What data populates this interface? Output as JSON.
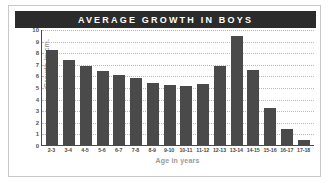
{
  "card": {
    "title": "AVERAGE GROWTH IN BOYS",
    "title_bg_color": "#2b2b2b",
    "title_text_color": "#ffffff",
    "border_color": "#c8c8c8",
    "background_color": "#ffffff"
  },
  "chart_data": {
    "type": "bar",
    "title": "AVERAGE GROWTH IN BOYS",
    "xlabel": "Age in years",
    "ylabel": "Growth in cm.",
    "categories": [
      "2-3",
      "3-4",
      "4-5",
      "5-6",
      "6-7",
      "7-8",
      "8-9",
      "9-10",
      "10-11",
      "11-12",
      "12-13",
      "13-14",
      "14-15",
      "15-16",
      "16-17",
      "17-18"
    ],
    "values": [
      8.2,
      7.3,
      6.8,
      6.4,
      6.0,
      5.8,
      5.35,
      5.15,
      5.05,
      5.25,
      6.8,
      9.4,
      6.5,
      3.2,
      1.4,
      0.4
    ],
    "ylim": [
      0,
      10
    ],
    "yticks": [
      0,
      1,
      2,
      3,
      4,
      5,
      6,
      7,
      8,
      9,
      10
    ],
    "ytick_labels": [
      "0",
      "1",
      "2",
      "3",
      "4",
      "5",
      "6",
      "7",
      "8",
      "9",
      "10"
    ],
    "grid": true,
    "grid_orientation": "horizontal",
    "grid_style": "dotted",
    "grid_color": "#b9b9b9",
    "legend": false,
    "bar_color": "#4a4a4a",
    "axis_color": "#4a4a4a",
    "label_color": "#9a9a9a",
    "tick_color": "#555555"
  }
}
